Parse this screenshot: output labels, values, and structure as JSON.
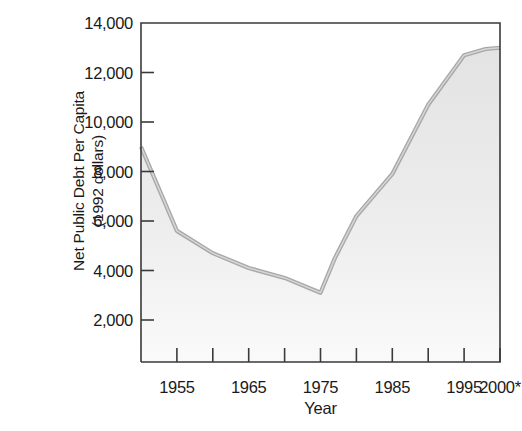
{
  "chart_data": {
    "type": "area",
    "title": "",
    "xlabel": "Year",
    "ylabel_line1": "Net Public Debt Per Capita",
    "ylabel_line2": "(1992 dollars)",
    "xlim": [
      1950,
      2000
    ],
    "ylim": [
      0,
      14000
    ],
    "grid": false,
    "legend": null,
    "y_ticks": [
      2000,
      4000,
      6000,
      8000,
      10000,
      12000,
      14000
    ],
    "y_tick_labels": [
      "2,000",
      "4,000",
      "6,000",
      "8,000",
      "10,000",
      "12,000",
      "14,000"
    ],
    "x_ticks": [
      1950,
      1955,
      1960,
      1965,
      1970,
      1975,
      1980,
      1985,
      1990,
      1995,
      2000
    ],
    "x_tick_labels": [
      "",
      "1955",
      "",
      "1965",
      "",
      "1975",
      "",
      "1985",
      "",
      "1995",
      "2000*"
    ],
    "x_labeled_ticks": [
      {
        "year": 1955,
        "label": "1955"
      },
      {
        "year": 1965,
        "label": "1965"
      },
      {
        "year": 1975,
        "label": "1975"
      },
      {
        "year": 1985,
        "label": "1985"
      },
      {
        "year": 1995,
        "label": "1995"
      },
      {
        "year": 2000,
        "label": "2000*"
      }
    ],
    "x": [
      1950,
      1955,
      1960,
      1965,
      1970,
      1975,
      1977,
      1980,
      1985,
      1990,
      1995,
      1998,
      2000
    ],
    "values": [
      9000,
      5600,
      4700,
      4100,
      3700,
      3100,
      4500,
      6200,
      7900,
      10700,
      12700,
      12950,
      13000
    ],
    "series": [
      {
        "name": "Net public debt per capita",
        "values": [
          9000,
          5600,
          4700,
          4100,
          3700,
          3100,
          4500,
          6200,
          7900,
          10700,
          12700,
          12950,
          13000
        ]
      }
    ],
    "annotations": [
      "* projected"
    ],
    "colors": {
      "line": "#a8a8a8",
      "fill_top": "#e3e3e3",
      "fill_bottom": "#fafafa",
      "axis": "#3a3a3a",
      "text": "#1a1a1a"
    }
  }
}
